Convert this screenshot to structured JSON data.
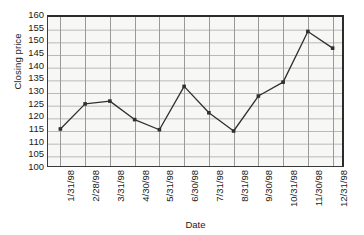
{
  "chart_data": {
    "type": "line",
    "title": "",
    "xlabel": "Date",
    "ylabel": "Closing price",
    "categories": [
      "1/31/98",
      "2/28/98",
      "3/31/98",
      "4/30/98",
      "5/31/98",
      "6/30/98",
      "7/31/98",
      "8/31/98",
      "9/30/98",
      "10/31/98",
      "11/30/98",
      "12/31/98"
    ],
    "values": [
      115.8,
      125.7,
      126.8,
      119.5,
      115.5,
      132.6,
      122.2,
      115.0,
      128.8,
      134.3,
      154.3,
      147.7
    ],
    "ylim": [
      100,
      160
    ],
    "ytick_labels": [
      "160",
      "155",
      "150",
      "145",
      "140",
      "135",
      "130",
      "125",
      "120",
      "115",
      "110",
      "105",
      "100"
    ],
    "ytick_values": [
      160,
      155,
      150,
      145,
      140,
      135,
      130,
      125,
      120,
      115,
      110,
      105,
      100
    ],
    "grid": "both",
    "legend": "none",
    "series_color": "#303030",
    "marker": "square",
    "plot_background": "#f7f7f5",
    "grid_color": "#b9b9b9"
  }
}
